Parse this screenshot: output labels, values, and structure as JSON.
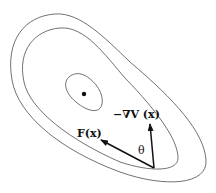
{
  "diagram": {
    "labels": {
      "neg_grad": "−∇V (x)",
      "force": "F(x)",
      "angle": "θ"
    },
    "elements": {
      "contours": [
        "outer-contour",
        "middle-contour",
        "inner-contour"
      ],
      "minimum_point": "equilibrium-dot",
      "vectors": [
        "force-vector",
        "negative-gradient-vector"
      ]
    },
    "colors": {
      "stroke": "#333333",
      "vector": "#111111",
      "background": "#ffffff"
    }
  }
}
